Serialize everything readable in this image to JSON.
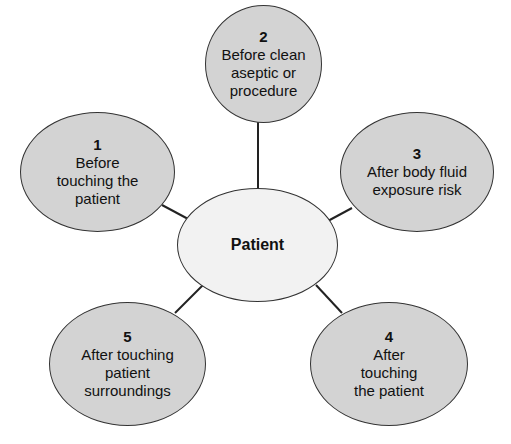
{
  "center": {
    "label": "Patient"
  },
  "nodes": [
    {
      "number": "1",
      "label_lines": [
        "Before",
        "touching the",
        "patient"
      ]
    },
    {
      "number": "2",
      "label_lines": [
        "Before clean",
        "aseptic or",
        "procedure"
      ]
    },
    {
      "number": "3",
      "label_lines": [
        "After body fluid",
        "exposure risk"
      ]
    },
    {
      "number": "4",
      "label_lines": [
        "After",
        "touching",
        "the patient"
      ]
    },
    {
      "number": "5",
      "label_lines": [
        "After touching",
        "patient",
        "surroundings"
      ]
    }
  ],
  "colors": {
    "node_fill": "#d3d3d3",
    "center_fill": "#f2f2f2",
    "stroke": "#333333"
  }
}
